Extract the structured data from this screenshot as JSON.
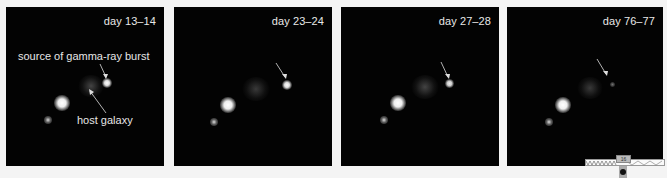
{
  "figure": {
    "panels": [
      {
        "day_label": "day 13–14",
        "annotations": {
          "burst_label": "source of gamma-ray burst",
          "galaxy_label": "host galaxy"
        },
        "burst_brightness": "bright"
      },
      {
        "day_label": "day 23–24",
        "burst_brightness": "bright"
      },
      {
        "day_label": "day 27–28",
        "burst_brightness": "medium"
      },
      {
        "day_label": "day 76–77",
        "burst_brightness": "faint"
      }
    ],
    "colors": {
      "background": "#f4f4f4",
      "panel_background": "#030303",
      "label_text": "#e8e8e8"
    }
  },
  "overlay_widget": {
    "tag_text": "16"
  }
}
